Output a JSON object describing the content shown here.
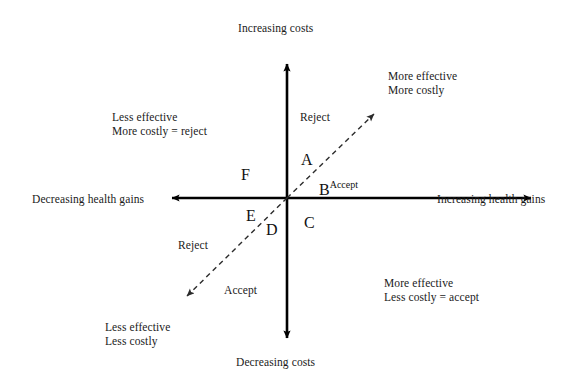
{
  "diagram": {
    "axes": {
      "top_label": "Increasing costs",
      "bottom_label": "Decreasing costs",
      "left_label": "Decreasing health gains",
      "right_label": "Increasing health gains"
    },
    "quadrant_notes": {
      "top_left_line1": "Less effective",
      "top_left_line2": "More costly = reject",
      "top_right_line1": "More effective",
      "top_right_line2": "More costly",
      "bottom_right_line1": "More effective",
      "bottom_right_line2": "Less costly = accept",
      "bottom_left_line1": "Less effective",
      "bottom_left_line2": "Less costly"
    },
    "threshold_line": {
      "upper_decision": "Reject",
      "lower_decision_upper_side": "Reject",
      "lower_decision_lower_side": "Accept",
      "accept_superscript": "Accept"
    },
    "points": [
      {
        "id": "A",
        "label": "A"
      },
      {
        "id": "B",
        "label": "B",
        "superscript": "Accept"
      },
      {
        "id": "C",
        "label": "C"
      },
      {
        "id": "D",
        "label": "D"
      },
      {
        "id": "E",
        "label": "E"
      },
      {
        "id": "F",
        "label": "F"
      }
    ],
    "colors": {
      "axis": "#000000",
      "threshold": "#3a3a3a",
      "text": "#1a1a1a",
      "background": "#ffffff"
    }
  }
}
